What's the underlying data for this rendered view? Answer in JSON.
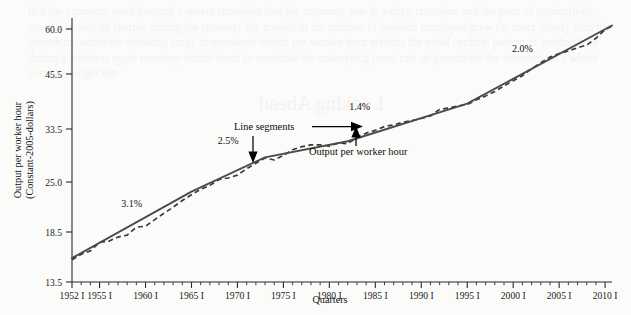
{
  "figure": {
    "background_color": "#fbfbfa",
    "line_color": "#4a4a4a",
    "data_line_color": "#3a3a3a"
  },
  "bleed_text": {
    "paragraph": "that the economy went through a severe recession that the economy was in a deep recession and the pace of productivity growth picked up sharply during the recovery the growth in the number of workers employed grew far more slowly than the growth in output the resulting surge in measured output per worker hour reflects the usual cyclical pattern of productivity during a business cycle recovery which tends to overstate the underlying trend rate of growth for the economy as a whole over the longer run",
    "heading": "Looking Ahead"
  },
  "chart_data": {
    "type": "line",
    "title": "",
    "xlabel": "Quarters",
    "ylabel": "Output per worker hour (Constant-2005-dollars)",
    "ylabel_line1": "Output per worker hour",
    "ylabel_line2": "(Constant-2005-dollars)",
    "yscale": "log",
    "ylim": [
      13.5,
      60.0
    ],
    "ytick_labels": [
      "13.5",
      "18.5",
      "25.0",
      "33.5",
      "45.5",
      "60.0"
    ],
    "ytick_values": [
      13.5,
      18.5,
      25.0,
      33.5,
      45.5,
      60.0
    ],
    "xlim": [
      1952,
      2010.75
    ],
    "xtick_labels": [
      "1952 I",
      "1955 I",
      "1960 I",
      "1965 I",
      "1970 I",
      "1975 I",
      "1980 I",
      "1985 I",
      "1990 I",
      "1995 I",
      "2000 I",
      "2005 I",
      "2010 I"
    ],
    "xtick_values": [
      1952,
      1955,
      1960,
      1965,
      1970,
      1975,
      1980,
      1985,
      1990,
      1995,
      2000,
      2005,
      2010
    ],
    "minor_tick_interval_years": 1,
    "grid": false,
    "legend": "none",
    "series": [
      {
        "name": "Output per worker hour",
        "style": "dashed",
        "x": [
          1952.0,
          1953.0,
          1954.0,
          1955.0,
          1956.0,
          1957.0,
          1958.0,
          1959.0,
          1960.0,
          1961.0,
          1962.0,
          1963.0,
          1964.0,
          1965.0,
          1966.0,
          1967.0,
          1968.0,
          1969.0,
          1970.0,
          1971.0,
          1972.0,
          1973.0,
          1974.0,
          1975.0,
          1976.0,
          1977.0,
          1978.0,
          1979.0,
          1980.0,
          1981.0,
          1982.0,
          1983.0,
          1984.0,
          1985.0,
          1986.0,
          1987.0,
          1988.0,
          1989.0,
          1990.0,
          1991.0,
          1992.0,
          1993.0,
          1994.0,
          1995.0,
          1996.0,
          1997.0,
          1998.0,
          1999.0,
          2000.0,
          2001.0,
          2002.0,
          2003.0,
          2004.0,
          2005.0,
          2006.0,
          2007.0,
          2008.0,
          2009.0,
          2010.0,
          2010.75
        ],
        "y": [
          15.3,
          15.8,
          16.1,
          16.9,
          17.0,
          17.4,
          17.6,
          18.4,
          18.5,
          19.2,
          19.9,
          20.6,
          21.4,
          22.1,
          22.8,
          23.3,
          24.1,
          24.3,
          24.7,
          25.6,
          26.4,
          27.2,
          26.9,
          27.6,
          28.5,
          29.0,
          29.3,
          29.3,
          29.1,
          29.6,
          29.5,
          30.5,
          31.3,
          31.8,
          32.5,
          32.8,
          33.3,
          33.6,
          34.0,
          34.5,
          35.8,
          36.1,
          36.5,
          36.8,
          37.8,
          38.6,
          39.6,
          40.9,
          42.1,
          43.3,
          45.0,
          46.6,
          48.1,
          49.1,
          49.8,
          50.7,
          51.5,
          53.5,
          56.2,
          57.3
        ]
      },
      {
        "name": "Line segments",
        "style": "solid",
        "breakpoints_x": [
          1952.0,
          1965.0,
          1973.0,
          1982.0,
          1995.0,
          2010.75
        ],
        "breakpoints_y": [
          15.45,
          22.5,
          27.3,
          29.9,
          37.0,
          57.5
        ]
      }
    ],
    "segment_growth_labels": [
      {
        "text": "3.1%",
        "x": 1958.5,
        "y_pos": 20.6
      },
      {
        "text": "2.5%",
        "x": 1969.0,
        "y_pos": 29.5
      },
      {
        "text": "1.4%",
        "x": 1983.3,
        "y_pos": 35.6
      },
      {
        "text": "2.0%",
        "x": 2001.0,
        "y_pos": 49.5
      }
    ],
    "annotations": [
      {
        "text": "Line segments",
        "kind": "callout",
        "targets": 2
      },
      {
        "text": "Output per worker hour",
        "kind": "callout",
        "targets": 1
      }
    ]
  }
}
